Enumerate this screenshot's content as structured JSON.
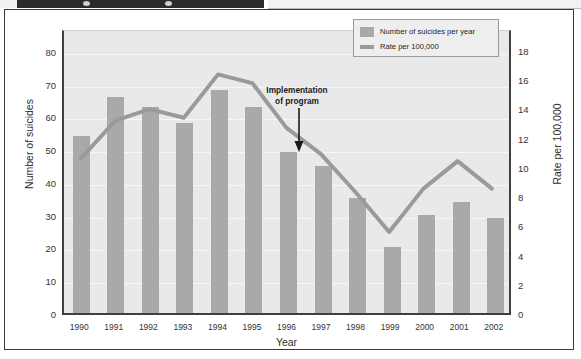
{
  "figure": {
    "background_color": "#ffffff",
    "plot_background_color": "#e9e9e9",
    "bar_color": "#a9a9a9",
    "line_color": "#9a9a9a",
    "axis_color": "#3f3f3f"
  },
  "legend": {
    "position": "top-right",
    "items": [
      {
        "label": "Number of suicides per year",
        "marker": "bar-swatch",
        "color": "#a9a9a9"
      },
      {
        "label": "Rate per 100,000",
        "marker": "line-swatch",
        "color": "#9a9a9a"
      }
    ]
  },
  "annotation": {
    "line1": "Implementation",
    "line2": "of program",
    "arrow_target_year": "1996"
  },
  "axes": {
    "x_title": "Year",
    "y_left_title": "Number of suicides",
    "y_right_title": "Rate per 100,000",
    "y_left_ticks": [
      "0",
      "10",
      "20",
      "30",
      "40",
      "50",
      "60",
      "70",
      "80"
    ],
    "y_right_ticks": [
      "0",
      "2",
      "4",
      "6",
      "8",
      "10",
      "12",
      "14",
      "16",
      "18"
    ]
  },
  "chart_data": {
    "type": "bar",
    "title": "",
    "subtitle": "",
    "xlabel": "Year",
    "ylabel": "Number of suicides",
    "y2label": "Rate per 100,000",
    "categories": [
      "1990",
      "1991",
      "1992",
      "1993",
      "1994",
      "1995",
      "1996",
      "1997",
      "1998",
      "1999",
      "2000",
      "2001",
      "2002"
    ],
    "ylim": [
      0,
      87
    ],
    "y2lim": [
      0,
      19.5
    ],
    "grid": true,
    "legend_position": "top-right",
    "annotations": [
      {
        "text": "Implementation of program",
        "x": "1996",
        "arrow": "down"
      }
    ],
    "series": [
      {
        "name": "Number of suicides per year",
        "type": "bar",
        "axis": "left",
        "color": "#a9a9a9",
        "values": [
          54,
          66,
          63,
          58,
          68,
          63,
          49,
          45,
          35,
          20,
          30,
          34,
          29
        ]
      },
      {
        "name": "Rate per 100,000",
        "type": "line",
        "axis": "right",
        "color": "#9a9a9a",
        "values": [
          10.7,
          13.3,
          14.1,
          13.5,
          16.5,
          15.9,
          12.8,
          11.0,
          8.4,
          5.6,
          8.6,
          10.5,
          8.6
        ]
      }
    ]
  }
}
